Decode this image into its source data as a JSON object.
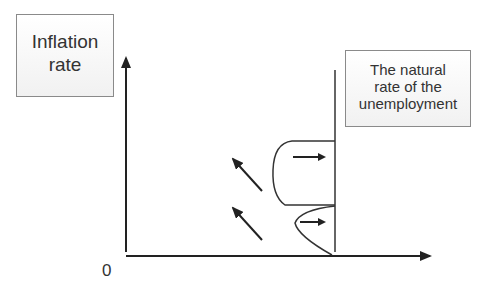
{
  "diagram": {
    "y_axis_label": "Inflation rate",
    "y_axis_label_lines": [
      "Inflation",
      "rate"
    ],
    "x_axis_origin": "0",
    "vertical_line_label": "The natural rate of the unemployment",
    "vertical_line_label_lines": [
      "The natural",
      "rate of the",
      "unemployment"
    ],
    "elements": {
      "axes": {
        "y_axis": "arrow up",
        "x_axis": "arrow right"
      },
      "vertical_line": "natural rate of unemployment",
      "upper_loop": {
        "shape": "rounded bump",
        "arrow": "right"
      },
      "lower_loop": {
        "shape": "curved wedge",
        "arrow": "right"
      },
      "diagonal_arrows": [
        "up-left",
        "up-left"
      ]
    },
    "colors": {
      "line": "#222222",
      "box_border": "#8a8a8a",
      "text": "#333333"
    }
  }
}
